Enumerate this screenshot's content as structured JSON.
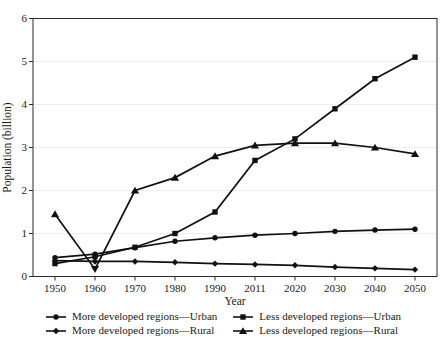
{
  "figure": {
    "background": "#ffffff",
    "line_color": "#111111",
    "grid_color": "#ededed",
    "frame_color": "#2b2b2b",
    "text_color": "#1a1a1a"
  },
  "chart_data": {
    "type": "line",
    "title": "",
    "xlabel": "Year",
    "ylabel": "Population (billion)",
    "x_tick_labels": [
      "1950",
      "1960",
      "1970",
      "1980",
      "1990",
      "2011",
      "2020",
      "2030",
      "2040",
      "2050"
    ],
    "y_ticks": [
      0,
      1,
      2,
      3,
      4,
      5,
      6
    ],
    "ylim": [
      0,
      6
    ],
    "grid": "horizontal-light",
    "legend_position": "bottom",
    "series": [
      {
        "name": "More developed regions—Urban",
        "marker": "circle",
        "values": [
          0.44,
          0.52,
          0.67,
          0.82,
          0.9,
          0.96,
          1.0,
          1.05,
          1.08,
          1.1
        ]
      },
      {
        "name": "More developed regions—Rural",
        "marker": "diamond",
        "values": [
          0.37,
          0.35,
          0.35,
          0.33,
          0.3,
          0.28,
          0.26,
          0.22,
          0.19,
          0.16
        ]
      },
      {
        "name": "Less developed regions—Urban",
        "marker": "square",
        "values": [
          0.3,
          0.46,
          0.68,
          1.0,
          1.5,
          2.7,
          3.2,
          3.9,
          4.6,
          5.1
        ]
      },
      {
        "name": "Less developed regions—Rural",
        "marker": "triangle",
        "values": [
          1.45,
          0.17,
          2.0,
          2.3,
          2.8,
          3.05,
          3.1,
          3.1,
          3.0,
          2.85
        ],
        "point_markers": {
          "1": "triangle-down"
        }
      }
    ]
  }
}
